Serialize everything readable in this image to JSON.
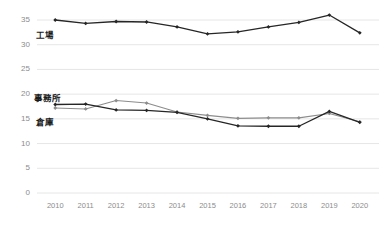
{
  "chart_data": {
    "type": "line",
    "title": "",
    "subtitle": "",
    "xlabel": "",
    "ylabel": "",
    "categories": [
      "2010",
      "2011",
      "2012",
      "2013",
      "2014",
      "2015",
      "2016",
      "2017",
      "2018",
      "2019",
      "2020"
    ],
    "x": [
      2010,
      2011,
      2012,
      2013,
      2014,
      2015,
      2016,
      2017,
      2018,
      2019,
      2020
    ],
    "ylim": [
      0,
      35
    ],
    "yticks": [
      0,
      5,
      10,
      15,
      20,
      25,
      30,
      35
    ],
    "ytick_labels": [
      "0",
      "5",
      "10",
      "15",
      "20",
      "25",
      "30",
      "35"
    ],
    "grid": true,
    "grid_axis": "y",
    "legend": "inline-labels",
    "legend_position": "inside-left",
    "series": [
      {
        "name": "工場",
        "color": "#262626",
        "marker": "diamond",
        "values": [
          35.0,
          34.3,
          34.7,
          34.6,
          33.6,
          32.2,
          32.6,
          33.6,
          34.5,
          36.0,
          32.4
        ]
      },
      {
        "name": "事務所",
        "color": "#8c8c8c",
        "marker": "diamond",
        "values": [
          17.2,
          17.0,
          18.7,
          18.2,
          16.4,
          15.7,
          15.1,
          15.2,
          15.2,
          16.1,
          14.4
        ]
      },
      {
        "name": "倉庫",
        "color": "#262626",
        "marker": "diamond",
        "values": [
          17.9,
          18.0,
          16.8,
          16.7,
          16.3,
          15.0,
          13.6,
          13.5,
          13.5,
          16.5,
          14.3
        ]
      }
    ],
    "annotations": [
      {
        "text": "工場",
        "series": "工場"
      },
      {
        "text": "事務所",
        "series": "事務所"
      },
      {
        "text": "倉庫",
        "series": "倉庫"
      }
    ],
    "colors": {
      "dark_series": "#262626",
      "light_series": "#8c8c8c",
      "gridline": "#e6e6e6",
      "tick_text": "#8c8c8c",
      "label_text": "#1a1a1a",
      "background": "#ffffff"
    }
  }
}
